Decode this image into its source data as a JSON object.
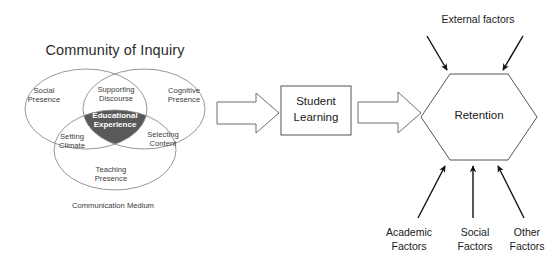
{
  "figure": {
    "type": "concept-flow-diagram",
    "background_color": "#ffffff",
    "line_color": "#4d4d4d",
    "accent_fill": "#595959",
    "accent_text_color": "#ffffff"
  },
  "community_of_inquiry": {
    "title": "Community of Inquiry",
    "circles": [
      {
        "id": "social",
        "label": "Social\nPresence"
      },
      {
        "id": "cognitive",
        "label": "Cognitive\nPresence"
      },
      {
        "id": "teaching",
        "label": "Teaching\nPresence"
      }
    ],
    "intersections": [
      {
        "id": "supporting-discourse",
        "label": "Supporting\nDiscourse"
      },
      {
        "id": "setting-climate",
        "label": "Setting\nClimate"
      },
      {
        "id": "selecting-content",
        "label": "Selecting\nContent"
      },
      {
        "id": "educational-experience",
        "label": "Educational\nExperience"
      }
    ],
    "caption": "Communication Medium"
  },
  "flow": {
    "arrow_1": "block-arrow-right",
    "student_learning": "Student\nLearning",
    "arrow_2": "block-arrow-right",
    "retention": "Retention"
  },
  "influences": {
    "top": {
      "label": "External factors",
      "arrow_count": 2
    },
    "bottom": {
      "arrow_count": 3,
      "labels": [
        "Academic\nFactors",
        "Social\nFactors",
        "Other\nFactors"
      ]
    }
  }
}
